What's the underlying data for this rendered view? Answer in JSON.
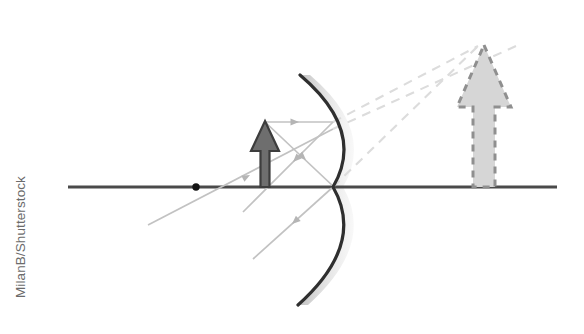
{
  "figure": {
    "watermark": "MilanB/Shutterstock"
  },
  "colors": {
    "axis": "#4a4a4a",
    "mirror_line": "#2f2f2f",
    "mirror_glow": "#c9c9c9",
    "object_fill": "#6e6e6e",
    "object_stroke": "#3d3d3d",
    "image_fill": "#d4d4d4",
    "image_stroke": "#8a8a8a",
    "ray_solid": "#b9b9b9",
    "ray_dashed": "#d8d8d8",
    "focal_point": "#141414",
    "background": "#ffffff"
  },
  "elements": {
    "principal_axis": {
      "label": "principal axis",
      "x1": 68,
      "y1": 187,
      "x2": 557,
      "y2": 187,
      "stroke_width": 3
    },
    "mirror": {
      "label": "convex mirror",
      "type": "convex",
      "top_x": 300,
      "top_y": 75,
      "vertex_x": 333,
      "vertex_y": 187,
      "bottom_x": 298,
      "bottom_y": 305,
      "stroke_width": 3.2
    },
    "focal_point": {
      "label": "focal point",
      "cx": 196,
      "cy": 187,
      "r": 3.6
    },
    "object_arrow": {
      "label": "object",
      "base_x": 265,
      "base_y": 187,
      "tip_y": 122,
      "stem_width": 9,
      "head_width": 28,
      "head_height": 30
    },
    "image_arrow": {
      "label": "virtual image",
      "base_x": 484,
      "base_y": 187,
      "tip_y": 45,
      "stem_width": 15,
      "head_width": 54,
      "head_height": 62,
      "dashed": true
    },
    "rays": [
      {
        "name": "incident-parallel-ray",
        "style": "solid",
        "points": "265,122 333,122",
        "arrow_at": "294,122",
        "arrow_angle": 0
      },
      {
        "name": "reflected-divergent-ray-upper",
        "style": "solid",
        "points": "333,122 243,212",
        "arrow_at": "296,159",
        "arrow_angle": 135
      },
      {
        "name": "virtual-extension-ray-upper",
        "style": "dashed",
        "points": "333,122 476,46"
      },
      {
        "name": "incident-vertex-ray",
        "style": "solid",
        "points": "265,122 333,187",
        "arrow_at": "302,157",
        "arrow_angle": 43
      },
      {
        "name": "reflected-vertex-ray",
        "style": "solid",
        "points": "333,187 253,259",
        "arrow_at": "294,222",
        "arrow_angle": 138
      },
      {
        "name": "virtual-extension-ray-lower",
        "style": "dashed",
        "points": "333,187 476,46"
      },
      {
        "name": "focal-construction-ray",
        "style": "solid",
        "points": "148,225 333,129",
        "arrow_at": "246,177",
        "arrow_angle": -27
      },
      {
        "name": "focal-construction-ray-extension",
        "style": "dashed",
        "points": "333,129 512,48"
      }
    ]
  }
}
